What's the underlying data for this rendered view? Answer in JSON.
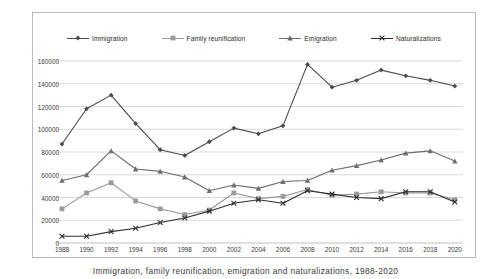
{
  "caption": "Immigration, family reunification, emigration and naturalizations, 1988-2020",
  "legend": {
    "position": "top",
    "items": [
      {
        "label": "Immigration",
        "marker": "diamond",
        "color": "#4a4a4a"
      },
      {
        "label": "Family reunification",
        "marker": "square",
        "color": "#9a9a9a"
      },
      {
        "label": "Emigration",
        "marker": "triangle",
        "color": "#6d6d6d"
      },
      {
        "label": "Naturalizations",
        "marker": "cross",
        "color": "#2f2f2f"
      }
    ]
  },
  "axes": {
    "y_ticks": [
      "0",
      "20000",
      "40000",
      "60000",
      "80000",
      "100000",
      "120000",
      "140000",
      "160000"
    ],
    "x_ticks": [
      "1988",
      "1990",
      "1992",
      "1994",
      "1996",
      "1998",
      "2000",
      "2002",
      "2004",
      "2006",
      "2008",
      "2010",
      "2012",
      "2014",
      "2016",
      "2018",
      "2020"
    ],
    "grid": "horizontal"
  },
  "chart_data": {
    "type": "line",
    "title": "",
    "xlabel": "",
    "ylabel": "",
    "ylim": [
      0,
      160000
    ],
    "grid": true,
    "legend_position": "top",
    "categories": [
      1988,
      1990,
      1992,
      1994,
      1996,
      1998,
      2000,
      2002,
      2004,
      2006,
      2008,
      2010,
      2012,
      2014,
      2016,
      2018,
      2020
    ],
    "series": [
      {
        "name": "Immigration",
        "marker": "diamond",
        "color": "#4a4a4a",
        "values": [
          87000,
          118000,
          130000,
          105000,
          82000,
          77000,
          89000,
          101000,
          96000,
          103000,
          157000,
          137000,
          143000,
          152000,
          147000,
          143000,
          138000
        ]
      },
      {
        "name": "Family reunification",
        "marker": "square",
        "color": "#9a9a9a",
        "values": [
          30000,
          44000,
          53000,
          37000,
          30000,
          25000,
          29000,
          44000,
          39000,
          41000,
          47000,
          42000,
          43000,
          45000,
          44000,
          44000,
          38000
        ]
      },
      {
        "name": "Emigration",
        "marker": "triangle",
        "color": "#6d6d6d",
        "values": [
          55000,
          60000,
          81000,
          65000,
          63000,
          58000,
          46000,
          51000,
          48000,
          54000,
          55000,
          64000,
          68000,
          73000,
          79000,
          81000,
          72000
        ]
      },
      {
        "name": "Naturalizations",
        "marker": "cross",
        "color": "#2f2f2f",
        "values": [
          6000,
          6000,
          10000,
          13000,
          18000,
          22000,
          28000,
          35000,
          38000,
          35000,
          46000,
          43000,
          40000,
          39000,
          45000,
          45000,
          36000
        ]
      }
    ]
  }
}
